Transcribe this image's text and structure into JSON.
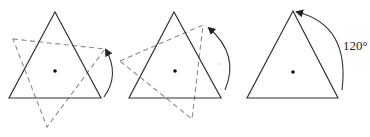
{
  "diagram": {
    "colors": {
      "solid_stroke": "#333333",
      "dashed_stroke": "#8c8c8c",
      "center_dot": "#111111"
    },
    "panels": [
      {
        "id": "panel-1",
        "solid_triangle": [
          [
            55,
            12
          ],
          [
            9,
            98
          ],
          [
            101,
            98
          ]
        ],
        "center": [
          55,
          71
        ],
        "dashed_triangle": [
          [
            13,
            39
          ],
          [
            105,
            49
          ],
          [
            47,
            127
          ]
        ],
        "arrow": {
          "from": [
            104,
            97
          ],
          "to": [
            106,
            49
          ]
        }
      },
      {
        "id": "panel-2",
        "solid_triangle": [
          [
            174,
            12
          ],
          [
            129,
            98
          ],
          [
            221,
            98
          ]
        ],
        "center": [
          175,
          71
        ],
        "dashed_triangle": [
          [
            120,
            61
          ],
          [
            203,
            25
          ],
          [
            192,
            119
          ]
        ],
        "arrow": {
          "from": [
            225,
            90
          ],
          "to": [
            208,
            27
          ]
        }
      },
      {
        "id": "panel-3",
        "solid_triangle": [
          [
            293,
            11
          ],
          [
            247,
            98
          ],
          [
            338,
            98
          ]
        ],
        "center": [
          293,
          72
        ],
        "arrow": {
          "from": [
            342,
            90
          ],
          "to": [
            296,
            11
          ]
        },
        "angle_label": "120°"
      }
    ]
  }
}
